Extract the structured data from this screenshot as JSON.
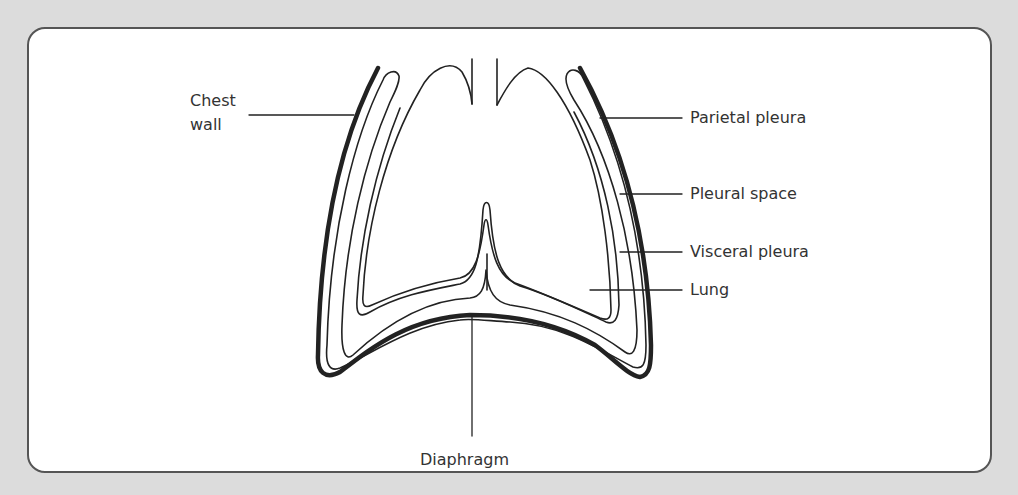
{
  "diagram": {
    "labels": {
      "chest_wall_line1": "Chest",
      "chest_wall_line2": "wall",
      "parietal_pleura": "Parietal pleura",
      "pleural_space": "Pleural space",
      "visceral_pleura": "Visceral pleura",
      "lung": "Lung",
      "diaphragm": "Diaphragm"
    },
    "colors": {
      "background": "#dcdcdc",
      "card": "#ffffff",
      "stroke": "#222222",
      "text": "#333333"
    }
  }
}
